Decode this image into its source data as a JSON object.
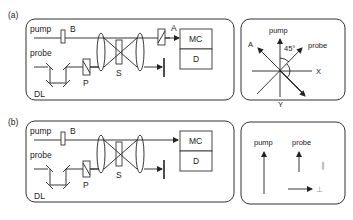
{
  "panels": {
    "a": {
      "label": "(a)",
      "setup": {
        "beams": {
          "pump": "pump",
          "probe": "probe"
        },
        "components": {
          "beam_block": "B",
          "delay_line": "DL",
          "polarizer": "P",
          "sample": "S",
          "analyzer": "A",
          "monochromator": "MC",
          "detector": "D"
        }
      },
      "polarization": {
        "pump": "pump",
        "probe": "probe",
        "analyzer": "A",
        "x_axis": "X",
        "y_axis": "Y",
        "angle": "45°"
      }
    },
    "b": {
      "label": "(b)",
      "setup": {
        "beams": {
          "pump": "pump",
          "probe": "probe"
        },
        "components": {
          "beam_block": "B",
          "delay_line": "DL",
          "polarizer": "P",
          "sample": "S",
          "monochromator": "MC",
          "detector": "D"
        }
      },
      "polarization": {
        "pump": "pump",
        "probe": "probe",
        "parallel": "∥",
        "perpendicular": "⊥"
      }
    }
  }
}
